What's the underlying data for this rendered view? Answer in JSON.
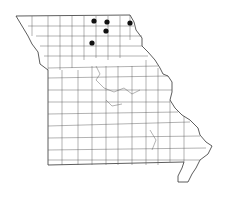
{
  "map": {
    "region": "Missouri",
    "subdivision": "counties",
    "colors": {
      "background": "#ffffff",
      "border": "#333333",
      "dot": "#111111"
    },
    "occurrence_dots": [
      {
        "x": 94,
        "y": 21
      },
      {
        "x": 107,
        "y": 22
      },
      {
        "x": 130,
        "y": 23
      },
      {
        "x": 106,
        "y": 31
      },
      {
        "x": 92,
        "y": 43
      }
    ]
  }
}
